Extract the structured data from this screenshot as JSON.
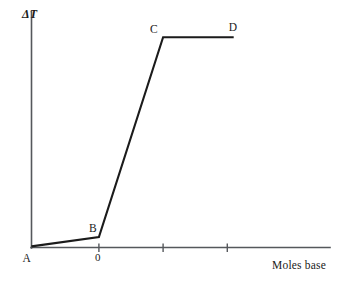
{
  "chart_data": {
    "type": "line",
    "title": "",
    "subtitle": "",
    "xlabel": "Moles base",
    "ylabel": "ΔT",
    "grid": false,
    "legend": "none",
    "xlim": [
      -1.05,
      3.6
    ],
    "ylim": [
      0,
      1.12
    ],
    "x_ticks": [
      0,
      1,
      2
    ],
    "x_tick_labels": [
      "0",
      "",
      ""
    ],
    "y_ticks": [],
    "y_tick_labels": [],
    "series": [
      {
        "name": "temperature rise",
        "x": [
          -1.05,
          0,
          1.0,
          2.1
        ],
        "y": [
          0.005,
          0.05,
          1.0,
          1.0
        ],
        "point_labels": [
          "A",
          "B",
          "C",
          "D"
        ]
      }
    ],
    "annotations": [
      {
        "text": "A",
        "x": -1.05,
        "y": 0.005,
        "position": "below-left"
      },
      {
        "text": "B",
        "x": 0,
        "y": 0.05,
        "position": "above-left"
      },
      {
        "text": "C",
        "x": 1.0,
        "y": 1.0,
        "position": "above-left"
      },
      {
        "text": "D",
        "x": 2.1,
        "y": 1.0,
        "position": "above-left"
      }
    ]
  },
  "axes": {
    "y_title": "ΔT",
    "x_title": "Moles base"
  },
  "labels": {
    "point_a": "A",
    "point_b": "B",
    "point_c": "C",
    "point_d": "D",
    "tick_zero": "0"
  },
  "colors": {
    "background": "#ffffff",
    "axis": "#55585c",
    "curve": "#1b1b1b",
    "text": "#1a1a1a"
  }
}
